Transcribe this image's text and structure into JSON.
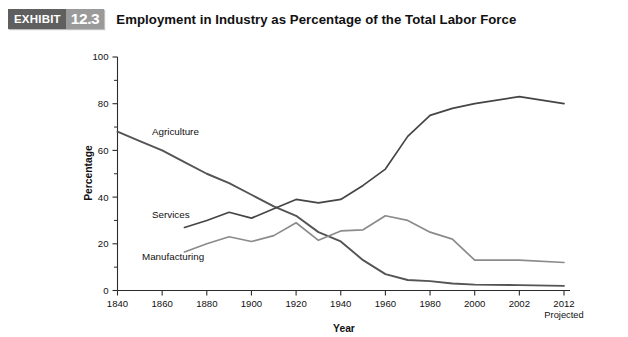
{
  "exhibit": {
    "badge_word": "EXHIBIT",
    "badge_number": "12.3",
    "title": "Employment in Industry as Percentage of the Total Labor Force"
  },
  "colors": {
    "agriculture": "#545454",
    "services": "#454545",
    "manufacturing": "#8b8b8b",
    "axis": "#2b2b2b",
    "badge_word_bg": "#5f5f5f",
    "badge_num_bg": "#9a9a9a"
  },
  "chart_data": {
    "type": "line",
    "title": "Employment in Industry as Percentage of the Total Labor Force",
    "xlabel": "Year",
    "ylabel": "Percentage",
    "ylim": [
      0,
      100
    ],
    "yticks": [
      0,
      20,
      40,
      60,
      80,
      100
    ],
    "yticks_minor": [
      10,
      30,
      50,
      70,
      90
    ],
    "grid": false,
    "legend": "inline-labels",
    "categories": [
      "1840",
      "1860",
      "1880",
      "1900",
      "1920",
      "1940",
      "1960",
      "1980",
      "2000",
      "2002",
      "2012"
    ],
    "x_tick_labels": [
      "1840",
      "1860",
      "1880",
      "1900",
      "1920",
      "1940",
      "1960",
      "1980",
      "2000",
      "2002",
      "2012"
    ],
    "x_last_sublabel": "Projected",
    "series": [
      {
        "name": "Agriculture",
        "color": "#545454",
        "x": [
          1840,
          1850,
          1860,
          1870,
          1880,
          1890,
          1900,
          1910,
          1920,
          1930,
          1940,
          1950,
          1960,
          1970,
          1980,
          1990,
          2000,
          2002,
          2012
        ],
        "values": [
          68,
          64,
          60,
          55,
          50,
          46,
          41,
          36,
          32,
          25,
          21,
          13,
          7,
          4.5,
          4,
          3,
          2.5,
          2.3,
          2
        ]
      },
      {
        "name": "Services",
        "color": "#454545",
        "x": [
          1870,
          1880,
          1890,
          1900,
          1910,
          1920,
          1930,
          1940,
          1950,
          1960,
          1970,
          1980,
          1990,
          2000,
          2002,
          2012
        ],
        "values": [
          27,
          30,
          33.5,
          31,
          35,
          39,
          37.5,
          39,
          45,
          52,
          66,
          75,
          78,
          80,
          83,
          80
        ]
      },
      {
        "name": "Manufacturing",
        "color": "#8b8b8b",
        "x": [
          1870,
          1880,
          1890,
          1900,
          1910,
          1920,
          1930,
          1940,
          1950,
          1960,
          1970,
          1980,
          1990,
          2000,
          2002,
          2012
        ],
        "values": [
          16.5,
          20,
          23,
          21,
          23.5,
          29,
          21.5,
          25.5,
          26,
          32,
          30,
          25,
          22,
          13,
          13,
          12
        ]
      }
    ],
    "series_labels": [
      {
        "text": "Agriculture",
        "series": "Agriculture"
      },
      {
        "text": "Services",
        "series": "Services"
      },
      {
        "text": "Manufacturing",
        "series": "Manufacturing"
      }
    ]
  }
}
